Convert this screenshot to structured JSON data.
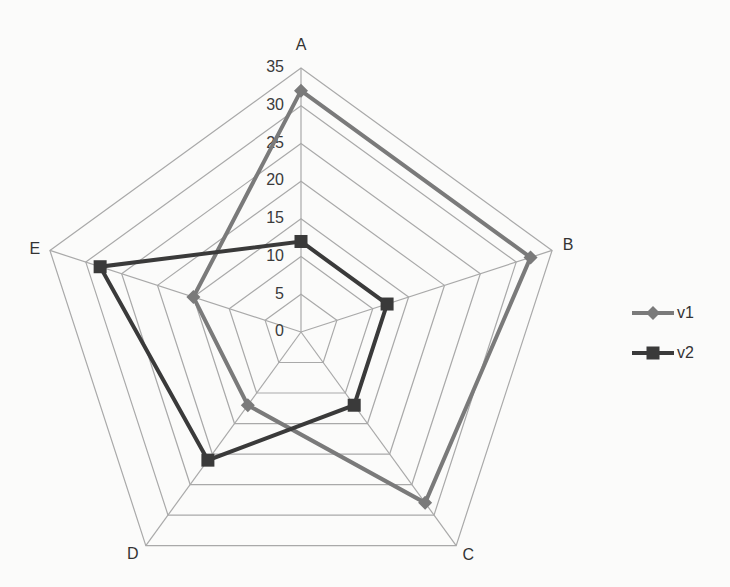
{
  "chart_data": {
    "type": "radar",
    "title": "",
    "categories": [
      "A",
      "B",
      "C",
      "D",
      "E"
    ],
    "series": [
      {
        "name": "v1",
        "values": [
          32,
          32,
          28,
          12,
          15
        ],
        "color": "#7a7a7a",
        "marker": "diamond",
        "line_width": 4
      },
      {
        "name": "v2",
        "values": [
          12,
          12,
          12,
          21,
          28
        ],
        "color": "#3a3a3a",
        "marker": "square",
        "line_width": 4
      }
    ],
    "axis": {
      "min": 0,
      "max": 35,
      "step": 5,
      "tick_labels": [
        "0",
        "5",
        "10",
        "15",
        "20",
        "25",
        "30",
        "35"
      ]
    },
    "grid": true,
    "legend": {
      "position": "right",
      "entries": [
        "v1",
        "v2"
      ]
    }
  }
}
